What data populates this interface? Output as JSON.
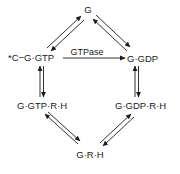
{
  "diagram": {
    "type": "reaction-cycle",
    "nodes": {
      "g": "G",
      "c_g_gtp": "*C−G·GTP",
      "g_gdp": "G·GDP",
      "g_gtp_r_h": "G·GTP·R·H",
      "g_gdp_r_h": "G·GDP·R·H",
      "g_r_h": "G·R·H"
    },
    "edges": [
      {
        "from": "c_g_gtp",
        "to": "g",
        "kind": "reversible"
      },
      {
        "from": "g",
        "to": "g_gdp",
        "kind": "reversible"
      },
      {
        "from": "c_g_gtp",
        "to": "g_gdp",
        "kind": "irreversible",
        "label": "GTPase"
      },
      {
        "from": "c_g_gtp",
        "to": "g_gtp_r_h",
        "kind": "reversible"
      },
      {
        "from": "g_gdp",
        "to": "g_gdp_r_h",
        "kind": "reversible"
      },
      {
        "from": "g_gtp_r_h",
        "to": "g_r_h",
        "kind": "reversible"
      },
      {
        "from": "g_gdp_r_h",
        "to": "g_r_h",
        "kind": "reversible"
      }
    ],
    "edge_labels": {
      "gtpase": "GTPase"
    },
    "colors": {
      "ink": "#1a1a1a",
      "background": "#ffffff"
    }
  }
}
